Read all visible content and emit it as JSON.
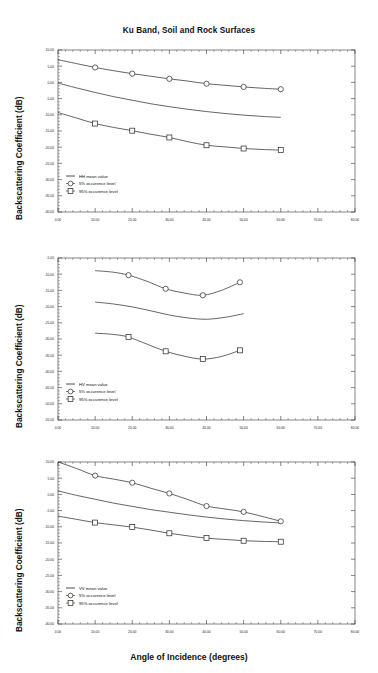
{
  "figure": {
    "title": "Ku Band, Soil and Rock Surfaces",
    "ylabel": "Backscattering Coefficient (dB)",
    "xlabel": "Angle of Incidence (degrees)"
  },
  "chart_data": [
    {
      "type": "line",
      "panel": "top",
      "title": "Ku Band, Soil and Rock Surfaces",
      "xlabel": "",
      "ylabel": "Backscattering Coefficient (dB)",
      "xlim": [
        0,
        80
      ],
      "ylim": [
        -40,
        10
      ],
      "xticks": [
        "0.00",
        "10.00",
        "20.00",
        "30.00",
        "40.00",
        "50.00",
        "60.00",
        "70.00",
        "80.00"
      ],
      "yticks": [
        "10.00",
        "5.00",
        "0.00",
        "-5.00",
        "-10.00",
        "-15.00",
        "-20.00",
        "-25.00",
        "-30.00",
        "-35.00",
        "-40.00"
      ],
      "grid": false,
      "legend_position": "lower-left",
      "series": [
        {
          "name": "HH mean value",
          "marker": "none",
          "x": [
            0,
            5,
            10,
            15,
            20,
            25,
            30,
            35,
            40,
            45,
            50,
            55,
            60
          ],
          "y": [
            -0.2,
            -1.7,
            -3.1,
            -4.4,
            -5.5,
            -6.6,
            -7.5,
            -8.3,
            -9.0,
            -9.6,
            -10.1,
            -10.5,
            -10.8
          ]
        },
        {
          "name": "5% occurence level",
          "marker": "circle",
          "x": [
            10,
            20,
            30,
            40,
            50,
            60
          ],
          "y": [
            4.6,
            2.7,
            1.1,
            -0.4,
            -1.4,
            -2.1
          ],
          "curve_x": [
            0,
            5,
            10,
            15,
            20,
            25,
            30,
            35,
            40,
            45,
            50,
            55,
            60
          ],
          "curve_y": [
            7.0,
            5.8,
            4.6,
            3.6,
            2.7,
            1.9,
            1.1,
            0.4,
            -0.4,
            -0.9,
            -1.4,
            -1.8,
            -2.1
          ]
        },
        {
          "name": "95% occurence level",
          "marker": "square",
          "x": [
            10,
            20,
            30,
            40,
            50,
            60
          ],
          "y": [
            -12.7,
            -14.9,
            -17.0,
            -19.4,
            -20.4,
            -20.9
          ],
          "curve_x": [
            0,
            5,
            10,
            15,
            20,
            25,
            30,
            35,
            40,
            45,
            50,
            55,
            60
          ],
          "curve_y": [
            -9.3,
            -11.0,
            -12.7,
            -13.9,
            -14.9,
            -16.0,
            -17.0,
            -18.3,
            -19.4,
            -19.9,
            -20.4,
            -20.7,
            -20.9
          ]
        }
      ]
    },
    {
      "type": "line",
      "panel": "middle",
      "title": "",
      "xlabel": "",
      "ylabel": "Backscattering Coefficient (dB)",
      "xlim": [
        0,
        80
      ],
      "ylim": [
        -55,
        -5
      ],
      "xticks": [
        "0.00",
        "10.00",
        "20.00",
        "30.00",
        "40.00",
        "50.00",
        "60.00",
        "70.00",
        "80.00"
      ],
      "yticks": [
        "-5.00",
        "-10.00",
        "-15.00",
        "-20.00",
        "-25.00",
        "-30.00",
        "-35.00",
        "-40.00",
        "-45.00",
        "-50.00",
        "-55.00"
      ],
      "grid": false,
      "legend_position": "lower-left",
      "series": [
        {
          "name": "HV mean value",
          "marker": "none",
          "x": [
            10,
            15,
            20,
            25,
            30,
            35,
            40,
            45,
            50
          ],
          "y": [
            -18.6,
            -19.2,
            -20.1,
            -21.3,
            -22.6,
            -23.5,
            -23.9,
            -23.3,
            -22.2
          ]
        },
        {
          "name": "5% occurence level",
          "marker": "circle",
          "x": [
            19,
            29,
            39,
            49
          ],
          "y": [
            -10.3,
            -14.5,
            -16.5,
            -12.5
          ],
          "curve_x": [
            10,
            15,
            19,
            24,
            29,
            34,
            39,
            44,
            49
          ],
          "curve_y": [
            -8.9,
            -9.4,
            -10.3,
            -12.2,
            -14.5,
            -15.8,
            -16.5,
            -15.0,
            -12.5
          ]
        },
        {
          "name": "95% occurence level",
          "marker": "square",
          "x": [
            19,
            29,
            39,
            49
          ],
          "y": [
            -29.4,
            -33.8,
            -36.2,
            -33.5
          ],
          "curve_x": [
            10,
            15,
            19,
            24,
            29,
            34,
            39,
            44,
            49
          ],
          "curve_y": [
            -28.2,
            -28.6,
            -29.4,
            -31.6,
            -33.8,
            -35.3,
            -36.2,
            -35.4,
            -33.5
          ]
        }
      ]
    },
    {
      "type": "line",
      "panel": "bottom",
      "title": "",
      "xlabel": "Angle of Incidence (degrees)",
      "ylabel": "Backscattering Coefficient (dB)",
      "xlim": [
        0,
        80
      ],
      "ylim": [
        -40,
        10
      ],
      "xticks": [
        "0.00",
        "10.00",
        "20.00",
        "30.00",
        "40.00",
        "50.00",
        "60.00",
        "70.00",
        "80.00"
      ],
      "yticks": [
        "10.00",
        "5.00",
        "0.00",
        "-5.00",
        "-10.00",
        "-15.00",
        "-20.00",
        "-25.00",
        "-30.00",
        "-35.00",
        "-40.00"
      ],
      "grid": false,
      "legend_position": "lower-left",
      "series": [
        {
          "name": "VV mean value",
          "marker": "none",
          "x": [
            0,
            5,
            10,
            15,
            20,
            25,
            30,
            35,
            40,
            45,
            50,
            55,
            60
          ],
          "y": [
            1.1,
            -0.3,
            -1.5,
            -2.7,
            -3.7,
            -4.7,
            -5.5,
            -6.3,
            -7.0,
            -7.6,
            -8.1,
            -8.5,
            -8.8
          ]
        },
        {
          "name": "5% occurence level",
          "marker": "circle",
          "x": [
            10,
            20,
            30,
            40,
            50,
            60
          ],
          "y": [
            5.8,
            3.6,
            0.3,
            -3.6,
            -5.4,
            -8.3
          ],
          "curve_x": [
            0,
            5,
            10,
            15,
            20,
            25,
            30,
            35,
            40,
            45,
            50,
            55,
            60
          ],
          "curve_y": [
            10.0,
            8.0,
            5.8,
            4.7,
            3.6,
            1.9,
            0.3,
            -1.6,
            -3.6,
            -4.5,
            -5.4,
            -6.8,
            -8.3
          ]
        },
        {
          "name": "95% occurence level",
          "marker": "square",
          "x": [
            10,
            20,
            30,
            40,
            50,
            60
          ],
          "y": [
            -8.7,
            -10.1,
            -12.0,
            -13.5,
            -14.3,
            -14.6
          ],
          "curve_x": [
            0,
            5,
            10,
            15,
            20,
            25,
            30,
            35,
            40,
            45,
            50,
            55,
            60
          ],
          "curve_y": [
            -6.7,
            -7.7,
            -8.7,
            -9.4,
            -10.1,
            -11.0,
            -12.0,
            -12.8,
            -13.5,
            -13.9,
            -14.3,
            -14.5,
            -14.6
          ]
        }
      ]
    }
  ],
  "colors": {
    "line": "#222222",
    "axis": "#333333",
    "text": "#111111",
    "background": "#ffffff"
  }
}
